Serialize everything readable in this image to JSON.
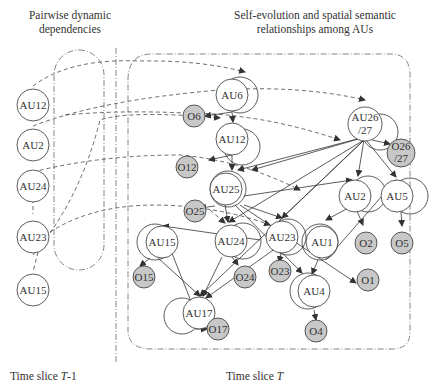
{
  "headers": {
    "left_line1": "Pairwise dynamic",
    "left_line2": "dependencies",
    "right_line1": "Self-evolution and spatial semantic",
    "right_line2": "relationships among AUs"
  },
  "footers": {
    "left_prefix": "Time slice ",
    "left_var": "T",
    "left_suffix": "-1",
    "right_prefix": "Time slice ",
    "right_var": "T"
  },
  "left_nodes": [
    {
      "id": "AU12",
      "label": "AU12"
    },
    {
      "id": "AU2",
      "label": "AU2"
    },
    {
      "id": "AU24",
      "label": "AU24"
    },
    {
      "id": "AU23",
      "label": "AU23"
    },
    {
      "id": "AU15",
      "label": "AU15"
    }
  ],
  "au_nodes": [
    {
      "id": "AU6",
      "label": "AU6"
    },
    {
      "id": "AU12",
      "label": "AU12"
    },
    {
      "id": "AU25",
      "label": "AU25"
    },
    {
      "id": "AU26",
      "label": "AU26",
      "label2": "/27"
    },
    {
      "id": "AU2",
      "label": "AU2"
    },
    {
      "id": "AU5",
      "label": "AU5"
    },
    {
      "id": "AU1",
      "label": "AU1"
    },
    {
      "id": "AU23",
      "label": "AU23"
    },
    {
      "id": "AU24",
      "label": "AU24"
    },
    {
      "id": "AU15",
      "label": "AU15"
    },
    {
      "id": "AU17",
      "label": "AU17"
    },
    {
      "id": "AU4",
      "label": "AU4"
    }
  ],
  "obs_nodes": [
    {
      "id": "O6",
      "label": "O6"
    },
    {
      "id": "O12",
      "label": "O12"
    },
    {
      "id": "O25",
      "label": "O25"
    },
    {
      "id": "O26",
      "label": "O26",
      "label2": "/27"
    },
    {
      "id": "O2",
      "label": "O2"
    },
    {
      "id": "O5",
      "label": "O5"
    },
    {
      "id": "O1",
      "label": "O1"
    },
    {
      "id": "O23",
      "label": "O23"
    },
    {
      "id": "O24",
      "label": "O24"
    },
    {
      "id": "O15",
      "label": "O15"
    },
    {
      "id": "O17",
      "label": "O17"
    },
    {
      "id": "O4",
      "label": "O4"
    }
  ],
  "colors": {
    "observation_fill": "#c8c8c8",
    "line": "#333333"
  }
}
